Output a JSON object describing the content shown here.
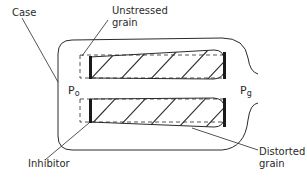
{
  "diagram": {
    "labels": {
      "case": "Case",
      "unstressed_grain_line1": "Unstressed",
      "unstressed_grain_line2": "grain",
      "inhibitor": "Inhibitor",
      "distorted_grain_line1": "Distorted",
      "distorted_grain_line2": "grain",
      "p0_base": "P",
      "p0_sub": "o",
      "pg_base": "P",
      "pg_sub": "g"
    },
    "colors": {
      "line": "#2a2a2a",
      "background": "#ffffff"
    }
  }
}
